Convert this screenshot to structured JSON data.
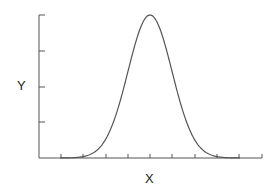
{
  "chart_data": {
    "type": "line",
    "title": "",
    "xlabel": "X",
    "ylabel": "Y",
    "x": [
      0,
      1,
      2,
      3,
      4,
      5,
      6,
      7,
      8,
      9,
      10
    ],
    "series": [
      {
        "name": "curve",
        "values": [
          0.0,
          0.0,
          0.01,
          0.13,
          0.61,
          1.0,
          0.61,
          0.13,
          0.01,
          0.0,
          0.0
        ]
      }
    ],
    "xlim": [
      0,
      10
    ],
    "ylim": [
      0,
      1
    ],
    "x_ticks": 10,
    "y_ticks": 4,
    "grid": false,
    "legend": null
  },
  "labels": {
    "x": "X",
    "y": "Y"
  },
  "colors": {
    "line": "#555555",
    "axis": "#555555"
  }
}
